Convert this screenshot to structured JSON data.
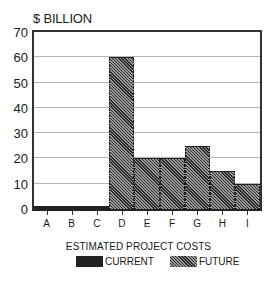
{
  "chart_data": {
    "type": "bar",
    "title": "ESTIMATED PROJECT COSTS",
    "xlabel": "",
    "ylabel": "$ BILLION",
    "ylim": [
      0,
      70
    ],
    "yticks": [
      0,
      10,
      20,
      30,
      40,
      50,
      60,
      70
    ],
    "grid": true,
    "legend_position": "bottom",
    "categories": [
      "A",
      "B",
      "C",
      "D",
      "E",
      "F",
      "G",
      "H",
      "I"
    ],
    "series": [
      {
        "name": "CURRENT",
        "style": "solid-dark",
        "values": [
          1,
          1,
          1,
          null,
          null,
          null,
          null,
          null,
          null
        ]
      },
      {
        "name": "FUTURE",
        "style": "hatched",
        "values": [
          null,
          null,
          null,
          60,
          20,
          20,
          25,
          15,
          10
        ]
      }
    ]
  },
  "labels": {
    "ylabel": "$ BILLION",
    "yticks": [
      "0",
      "10",
      "20",
      "30",
      "40",
      "50",
      "60",
      "70"
    ],
    "xticks": [
      "A",
      "B",
      "C",
      "D",
      "E",
      "F",
      "G",
      "H",
      "I"
    ],
    "legend_title": "ESTIMATED PROJECT COSTS",
    "legend_current": "CURRENT",
    "legend_future": "FUTURE"
  },
  "colors": {
    "current": "#222222",
    "future_hatch": "#777777",
    "grid": "#b5b5b5",
    "axis": "#333333"
  }
}
